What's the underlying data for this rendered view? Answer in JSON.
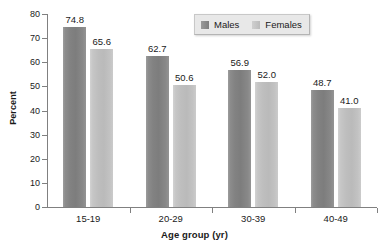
{
  "chart_data": {
    "type": "bar",
    "title": "",
    "xlabel": "Age group (yr)",
    "ylabel": "Percent",
    "categories": [
      "15-19",
      "20-29",
      "30-39",
      "40-49"
    ],
    "series": [
      {
        "name": "Males",
        "color": "#828282",
        "values": [
          74.8,
          62.7,
          56.9,
          48.7
        ]
      },
      {
        "name": "Females",
        "color": "#bebebe",
        "values": [
          65.6,
          50.6,
          52.0,
          41.0
        ]
      }
    ],
    "value_labels": {
      "males": [
        "74.8",
        "62.7",
        "56.9",
        "48.7"
      ],
      "females": [
        "65.6",
        "50.6",
        "52.0",
        "41.0"
      ]
    },
    "ylim": [
      0,
      80
    ],
    "yticks": [
      0,
      10,
      20,
      30,
      40,
      50,
      60,
      70,
      80
    ],
    "ytick_labels": [
      "0",
      "10",
      "20",
      "30",
      "40",
      "50",
      "60",
      "70",
      "80"
    ],
    "grid": false,
    "legend_position": "top-right"
  },
  "legend": {
    "items": [
      {
        "label": "Males",
        "swatch": "males-swatch"
      },
      {
        "label": "Females",
        "swatch": "females-swatch"
      }
    ]
  }
}
